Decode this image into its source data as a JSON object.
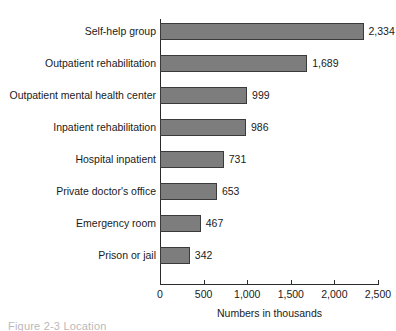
{
  "chart_data": {
    "type": "bar",
    "orientation": "horizontal",
    "title": "",
    "xlabel": "Numbers in thousands",
    "ylabel": "",
    "categories": [
      "Self-help group",
      "Outpatient rehabilitation",
      "Outpatient mental health center",
      "Inpatient rehabilitation",
      "Hospital inpatient",
      "Private doctor's office",
      "Emergency room",
      "Prison or jail"
    ],
    "values": [
      2334,
      1689,
      999,
      986,
      731,
      653,
      467,
      342
    ],
    "value_labels": [
      "2,334",
      "1,689",
      "999",
      "986",
      "731",
      "653",
      "467",
      "342"
    ],
    "xlim": [
      0,
      2500
    ],
    "xticks": [
      0,
      500,
      1000,
      1500,
      2000,
      2500
    ],
    "xtick_labels": [
      "0",
      "500",
      "1,000",
      "1,500",
      "2,000",
      "2,500"
    ],
    "grid": false,
    "legend": null,
    "bar_color": "#7d7d7d",
    "bar_border_color": "#3a3a3a",
    "axis_color": "#2b2b2b",
    "text_color": "#1a1a1a"
  },
  "caption_fragment": "Figure 2-3  Location"
}
